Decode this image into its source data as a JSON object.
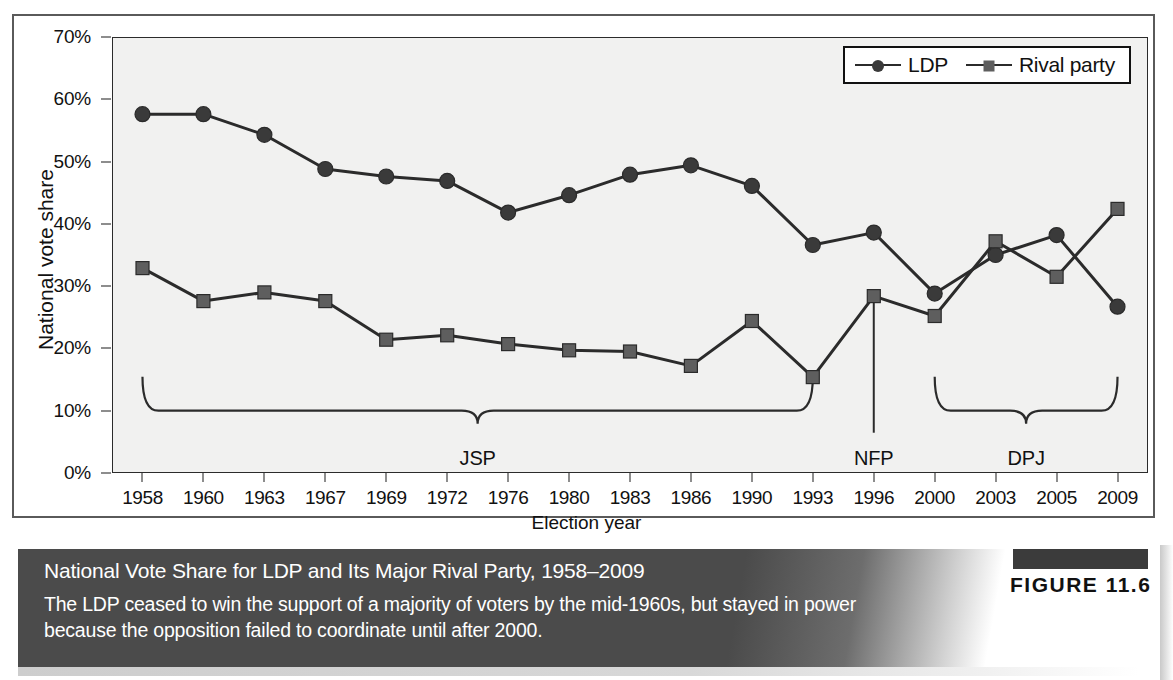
{
  "figure": {
    "tag": "FIGURE 11.6",
    "caption_title": "National Vote Share for LDP and Its Major Rival Party, 1958–2009",
    "caption_body": "The LDP ceased to win the support of a majority of voters by the mid-1960s, but stayed in power because the opposition failed to coordinate until after 2000."
  },
  "colors": {
    "ldp_marker": "#3a3a3a",
    "rival_marker": "#5e5e5e",
    "line": "#2b2b2b",
    "plot_bg": "#f1f1f0",
    "caption_bg": "#4b4b4b",
    "caption_text": "#ffffff",
    "axis": "#1d1d1d"
  },
  "chart_data": {
    "type": "line",
    "title": "National Vote Share for LDP and Its Major Rival Party, 1958–2009",
    "xlabel": "Election year",
    "ylabel": "National vote share",
    "categories": [
      "1958",
      "1960",
      "1963",
      "1967",
      "1969",
      "1972",
      "1976",
      "1980",
      "1983",
      "1986",
      "1990",
      "1993",
      "1996",
      "2000",
      "2003",
      "2005",
      "2009"
    ],
    "ytick_labels": [
      "0%",
      "10%",
      "20%",
      "30%",
      "40%",
      "50%",
      "60%",
      "70%"
    ],
    "ytick_values": [
      0,
      10,
      20,
      30,
      40,
      50,
      60,
      70
    ],
    "ylim": [
      0,
      70
    ],
    "grid": false,
    "legend_position": "top-right",
    "series": [
      {
        "name": "LDP",
        "marker": "circle",
        "values": [
          57.6,
          57.6,
          54.3,
          48.8,
          47.6,
          46.9,
          41.8,
          44.6,
          47.9,
          49.4,
          46.1,
          36.6,
          38.6,
          28.8,
          35.0,
          38.2,
          26.7
        ]
      },
      {
        "name": "Rival party",
        "marker": "square",
        "values": [
          32.9,
          27.6,
          29.0,
          27.6,
          21.4,
          22.1,
          20.7,
          19.7,
          19.5,
          17.2,
          24.4,
          15.4,
          28.4,
          25.2,
          37.2,
          31.5,
          42.4
        ]
      }
    ],
    "annotations": [
      {
        "label": "JSP",
        "type": "brace",
        "from": "1958",
        "to": "1993",
        "y": 10
      },
      {
        "label": "NFP",
        "type": "pointer",
        "at": "1996"
      },
      {
        "label": "DPJ",
        "type": "brace",
        "from": "2000",
        "to": "2009",
        "y": 10
      }
    ]
  },
  "legend": {
    "items": [
      {
        "label": "LDP",
        "marker": "circle-marker"
      },
      {
        "label": "Rival party",
        "marker": "square-marker"
      }
    ]
  }
}
